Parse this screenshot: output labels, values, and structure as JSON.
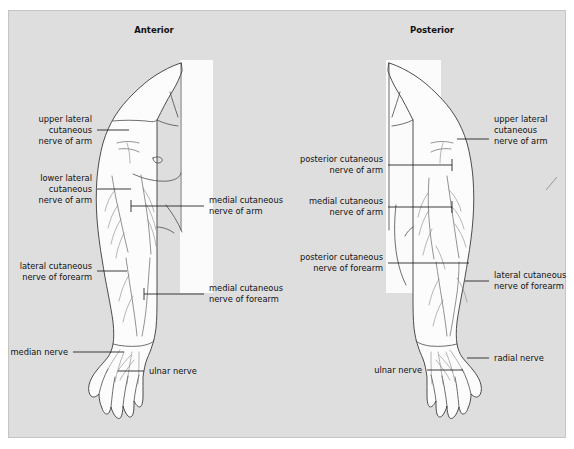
{
  "figure": {
    "panel": {
      "background_color": "#dedede",
      "border_color": "#c4c4c4",
      "page_background": "#ffffff"
    },
    "views": [
      {
        "id": "anterior",
        "title": "Anterior"
      },
      {
        "id": "posterior",
        "title": "Posterior"
      }
    ],
    "annotations": {
      "anterior": [
        {
          "id": "upper-lateral-cutaneous-nerve-of-arm",
          "lines": [
            "upper lateral",
            "cutaneous",
            "nerve of arm"
          ],
          "side": "left"
        },
        {
          "id": "lower-lateral-cutaneous-nerve-of-arm",
          "lines": [
            "lower lateral",
            "cutaneous",
            "nerve of arm"
          ],
          "side": "left"
        },
        {
          "id": "lateral-cutaneous-nerve-of-forearm",
          "lines": [
            "lateral cutaneous",
            "nerve of forearm"
          ],
          "side": "left"
        },
        {
          "id": "median-nerve",
          "lines": [
            "median nerve"
          ],
          "side": "left"
        },
        {
          "id": "medial-cutaneous-nerve-of-arm",
          "lines": [
            "medial cutaneous",
            "nerve of arm"
          ],
          "side": "right"
        },
        {
          "id": "medial-cutaneous-nerve-of-forearm",
          "lines": [
            "medial cutaneous",
            "nerve of forearm"
          ],
          "side": "right"
        },
        {
          "id": "ulnar-nerve",
          "lines": [
            "ulnar nerve"
          ],
          "side": "right"
        }
      ],
      "posterior": [
        {
          "id": "posterior-cutaneous-nerve-of-arm",
          "lines": [
            "posterior cutaneous",
            "nerve of arm"
          ],
          "side": "left"
        },
        {
          "id": "medial-cutaneous-nerve-of-arm",
          "lines": [
            "medial cutaneous",
            "nerve of arm"
          ],
          "side": "left"
        },
        {
          "id": "posterior-cutaneous-nerve-of-forearm",
          "lines": [
            "posterior cutaneous",
            "nerve of forearm"
          ],
          "side": "left"
        },
        {
          "id": "ulnar-nerve",
          "lines": [
            "ulnar nerve"
          ],
          "side": "left"
        },
        {
          "id": "upper-lateral-cutaneous-nerve-of-arm",
          "lines": [
            "upper lateral",
            "cutaneous",
            "nerve of arm"
          ],
          "side": "right"
        },
        {
          "id": "lateral-cutaneous-nerve-of-forearm",
          "lines": [
            "lateral cutaneous",
            "nerve of forearm"
          ],
          "side": "right"
        },
        {
          "id": "radial-nerve",
          "lines": [
            "radial nerve"
          ],
          "side": "right"
        }
      ]
    }
  }
}
